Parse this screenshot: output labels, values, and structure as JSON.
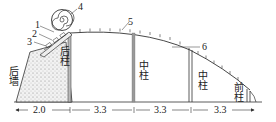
{
  "diagram": {
    "type": "greenhouse-cross-section",
    "labels": {
      "back_wall": "后墙",
      "back_pillar": "后柱",
      "middle_pillar_1": "中柱",
      "middle_pillar_2": "中柱",
      "front_pillar": "前柱"
    },
    "callouts": [
      "1",
      "2",
      "3",
      "4",
      "5",
      "6"
    ],
    "dimensions": [
      "2.0",
      "3.3",
      "3.3",
      "3.3",
      "3.3"
    ],
    "colors": {
      "line": "#333333",
      "pillar_fill": "#9a9a9a",
      "wall_fill": "#e6e6e6"
    }
  }
}
